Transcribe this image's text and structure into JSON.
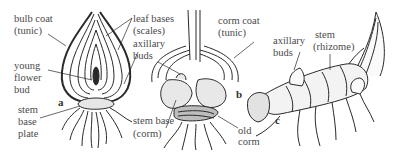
{
  "figure": {
    "panels": [
      {
        "id": "a",
        "subject": "bulb",
        "letter": "a",
        "labels": {
          "bulb_coat_1": "bulb coat",
          "bulb_coat_2": "(tunic)",
          "young_flower_1": "young",
          "young_flower_2": "flower",
          "young_flower_3": "bud",
          "stem_base_1": "stem",
          "stem_base_2": "base",
          "stem_base_3": "plate",
          "leaf_bases_1": "leaf bases",
          "leaf_bases_2": "(scales)",
          "axillary_1": "axillary",
          "axillary_2": "buds"
        }
      },
      {
        "id": "b",
        "subject": "corm",
        "letter": "b",
        "labels": {
          "corm_coat_1": "corm coat",
          "corm_coat_2": "(tunic)",
          "stem_base_1": "stem base",
          "stem_base_2": "(corm)",
          "old_corm_1": "old",
          "old_corm_2": "corm"
        }
      },
      {
        "id": "c",
        "subject": "rhizome",
        "letter": "c",
        "labels": {
          "axillary_1": "axillary",
          "axillary_2": "buds",
          "stem_1": "stem",
          "stem_2": "(rhizome)"
        }
      }
    ],
    "colors": {
      "ink": "#2a2a2a",
      "label": "#4a4a4a",
      "stipple": "#e6e6e6"
    }
  }
}
